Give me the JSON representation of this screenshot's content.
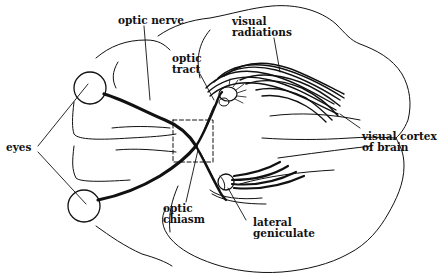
{
  "diagram": {
    "colors": {
      "ink": "#111111",
      "background": "#ffffff"
    },
    "labels": {
      "optic_nerve": [
        "optic nerve"
      ],
      "optic_tract": [
        "optic",
        "tract"
      ],
      "visual_radiations": [
        "visual",
        "radiations"
      ],
      "visual_cortex": [
        "visual cortex",
        "of brain"
      ],
      "eyes": [
        "eyes"
      ],
      "optic_chiasm": [
        "optic",
        "chiasm"
      ],
      "lateral_geniculate": [
        "lateral",
        "geniculate"
      ]
    }
  }
}
